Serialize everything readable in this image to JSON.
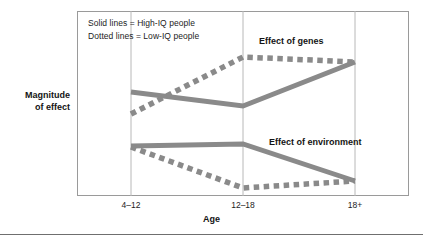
{
  "figure": {
    "y_axis_title_line1": "Magnitude",
    "y_axis_title_line2": "of effect",
    "x_axis_title": "Age",
    "bottom_rule_color": "#6f6f6f"
  },
  "legend": {
    "line1": "Solid lines = High-IQ people",
    "line2": "Dotted lines = Low-IQ people"
  },
  "annotations": {
    "genes": "Effect of genes",
    "environment": "Effect of environment"
  },
  "ticks": {
    "t0": "4–12",
    "t1": "12–18",
    "t2": "18+"
  },
  "colors": {
    "line": "#8a8a8a",
    "frame": "#9a9a9a",
    "gridline": "#b8b8b8",
    "text": "#141414"
  },
  "chart_data": {
    "type": "line",
    "title": "",
    "subtitle": "",
    "xlabel": "Age",
    "ylabel": "Magnitude of effect",
    "categories": [
      "4–12",
      "12–18",
      "18+"
    ],
    "x": [
      131,
      243,
      355
    ],
    "xlim": [
      77,
      409
    ],
    "ylim": [
      196,
      11
    ],
    "grid": true,
    "grid_axis": "x",
    "legend": {
      "position": "inside-top-left",
      "entries": [
        {
          "label": "Solid lines = High-IQ people",
          "style": "solid"
        },
        {
          "label": "Dotted lines = Low-IQ people",
          "style": "dotted"
        }
      ]
    },
    "y_axis_tick_labels": [],
    "note": "Y axis is unlabeled/qualitative: higher on the plot = larger magnitude of effect. Pixel y values are given for fidelity; magnitude_rel is a 0-1 normalized reading where 1 = top of plot area.",
    "series": [
      {
        "name": "Effect of genes — High-IQ people",
        "group": "genes",
        "style": "solid",
        "color": "#8a8a8a",
        "values_px": [
          92,
          106,
          62
        ],
        "magnitude_rel": [
          0.56,
          0.49,
          0.72
        ]
      },
      {
        "name": "Effect of genes — Low-IQ people",
        "group": "genes",
        "style": "dotted",
        "color": "#8a8a8a",
        "values_px": [
          114,
          57,
          62
        ],
        "magnitude_rel": [
          0.44,
          0.75,
          0.72
        ]
      },
      {
        "name": "Effect of environment — High-IQ people",
        "group": "environment",
        "style": "solid",
        "color": "#8a8a8a",
        "values_px": [
          146,
          144,
          181
        ],
        "magnitude_rel": [
          0.27,
          0.28,
          0.08
        ]
      },
      {
        "name": "Effect of environment — Low-IQ people",
        "group": "environment",
        "style": "dotted",
        "color": "#8a8a8a",
        "values_px": [
          147,
          188,
          181
        ],
        "magnitude_rel": [
          0.26,
          0.04,
          0.08
        ]
      }
    ],
    "annotations": [
      {
        "text": "Effect of genes",
        "x_px": 259,
        "y_px": 36
      },
      {
        "text": "Effect of environment",
        "x_px": 269,
        "y_px": 137
      }
    ]
  }
}
